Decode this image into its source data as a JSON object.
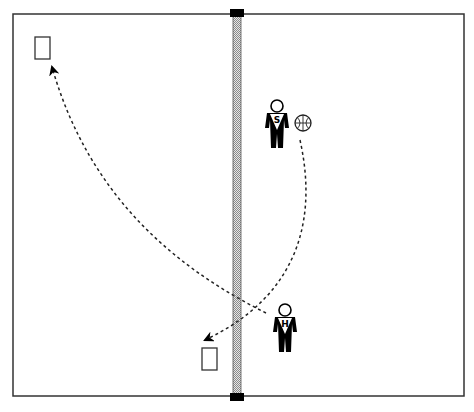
{
  "diagram": {
    "type": "volleyball-court-drill",
    "court": {
      "x": 13,
      "y": 14,
      "width": 451,
      "height": 382,
      "border_color": "#333333"
    },
    "net": {
      "x": 233,
      "width": 8,
      "cap_color": "#000000",
      "pattern_color": "#999999"
    },
    "players": [
      {
        "id": "player-s",
        "letter": "S",
        "x": 277,
        "y": 112
      },
      {
        "id": "player-h",
        "letter": "H",
        "x": 285,
        "y": 318
      }
    ],
    "ball": {
      "x": 303,
      "y": 123,
      "r": 8
    },
    "targets": [
      {
        "id": "target-left-top",
        "x": 35,
        "y": 37,
        "width": 15,
        "height": 22
      },
      {
        "id": "target-left-bottom",
        "x": 202,
        "y": 348,
        "width": 15,
        "height": 22
      }
    ],
    "paths": [
      {
        "id": "pass-path-s-to-bottom-target",
        "from": "ball",
        "to": "target-left-bottom"
      },
      {
        "id": "attack-path-h-to-top-target",
        "from": "player-h",
        "to": "target-left-top"
      }
    ]
  }
}
